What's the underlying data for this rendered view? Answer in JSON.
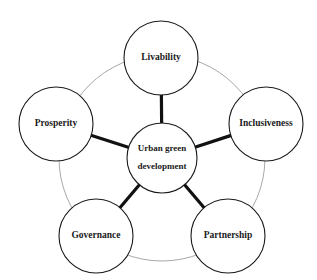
{
  "figure": {
    "type": "hub-and-spoke concept diagram",
    "background_color": "#ffffff"
  },
  "style": {
    "node_fill": "#ffffff",
    "node_stroke": "#1a1a1a",
    "node_stroke_width": 1.1,
    "spoke_color": "#111111",
    "spoke_width": 3.2,
    "ring_color": "#a8a8a8",
    "ring_width": 1,
    "text_color": "#1a1a1a"
  },
  "center_node": {
    "name": "urban-green-development",
    "label_line1": "Urban green",
    "label_line2": "development",
    "cx": 162,
    "cy": 158,
    "r": 35
  },
  "ring": {
    "name": "connector-ring",
    "cx": 162,
    "cy": 158,
    "r": 103
  },
  "outer_nodes": [
    {
      "name": "livability",
      "label": "Livability",
      "cx": 161,
      "cy": 58,
      "r": 37
    },
    {
      "name": "inclusiveness",
      "label": "Inclusiveness",
      "cx": 266,
      "cy": 124,
      "r": 37
    },
    {
      "name": "partnership",
      "label": "Partnership",
      "cx": 228,
      "cy": 236,
      "r": 37
    },
    {
      "name": "governance",
      "label": "Governance",
      "cx": 96,
      "cy": 236,
      "r": 37
    },
    {
      "name": "prosperity",
      "label": "Prosperity",
      "cx": 56,
      "cy": 124,
      "r": 37
    }
  ],
  "spokes": [
    {
      "name": "spoke-center-livability",
      "from": "urban-green-development",
      "to": "livability"
    },
    {
      "name": "spoke-center-inclusiveness",
      "from": "urban-green-development",
      "to": "inclusiveness"
    },
    {
      "name": "spoke-center-partnership",
      "from": "urban-green-development",
      "to": "partnership"
    },
    {
      "name": "spoke-center-governance",
      "from": "urban-green-development",
      "to": "governance"
    },
    {
      "name": "spoke-center-prosperity",
      "from": "urban-green-development",
      "to": "prosperity"
    }
  ]
}
